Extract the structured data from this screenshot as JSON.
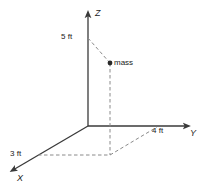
{
  "figure": {
    "background_color": "#ffffff",
    "line_color": "#3a3a3a",
    "dashed_color": "#8a8a8a",
    "text_color": "#1a1a1a"
  },
  "axes": [
    {
      "name": "z-axis",
      "label": "Z",
      "direction": "up"
    },
    {
      "name": "y-axis",
      "label": "Y",
      "direction": "right"
    },
    {
      "name": "x-axis",
      "label": "X",
      "direction": "down-left"
    }
  ],
  "dimension_labels": [
    {
      "name": "z-dimension",
      "text": "5 ft",
      "axis": "Z"
    },
    {
      "name": "y-dimension",
      "text": "4 ft",
      "axis": "Y"
    },
    {
      "name": "x-dimension",
      "text": "3 ft",
      "axis": "X"
    }
  ],
  "point": {
    "name": "mass",
    "label": "mass",
    "coordinates": {
      "x": 3,
      "y": 4,
      "z": 5
    },
    "units": "ft"
  },
  "labels": {
    "z_axis": "Z",
    "y_axis": "Y",
    "x_axis": "X",
    "z_value": "5 ft",
    "y_value": "4 ft",
    "x_value": "3 ft",
    "mass": "mass"
  }
}
